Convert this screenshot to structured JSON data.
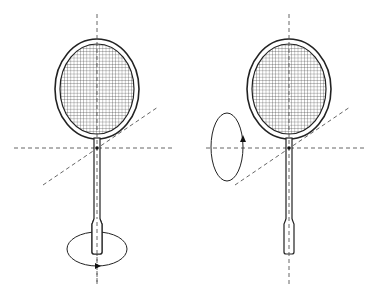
{
  "figure": {
    "width": 369,
    "height": 295,
    "background": "#ffffff",
    "stroke_color": "#222222",
    "axis_color": "#555555"
  },
  "panels": [
    {
      "id": "left",
      "racket": {
        "axis_x": 97,
        "head": {
          "cx": 97,
          "cy": 89,
          "rx_outer": 42,
          "ry_outer": 50,
          "rx_inner": 37,
          "ry_inner": 45
        },
        "shaft": {
          "x1": 94,
          "x2": 100,
          "y_top": 138,
          "y_bottom": 222
        },
        "handle": {
          "x1": 92,
          "x2": 102,
          "y_top": 222,
          "y_bottom": 254
        }
      },
      "axes": {
        "vertical": {
          "x": 97,
          "y1": 14,
          "y2": 285
        },
        "horizontal": {
          "y": 148,
          "x1": 14,
          "x2": 172
        },
        "diagonal": {
          "x1": 43,
          "y1": 185,
          "x2": 158,
          "y2": 107
        }
      },
      "pivot": {
        "x": 97,
        "y": 148
      },
      "rotation": {
        "type": "horizontal-ellipse",
        "cx": 97,
        "cy": 249,
        "rx": 30,
        "ry": 17,
        "arrow_direction": "right",
        "arrow_at": "bottom"
      }
    },
    {
      "id": "right",
      "racket": {
        "axis_x": 289,
        "head": {
          "cx": 289,
          "cy": 89,
          "rx_outer": 42,
          "ry_outer": 50,
          "rx_inner": 37,
          "ry_inner": 45
        },
        "shaft": {
          "x1": 286,
          "x2": 292,
          "y_top": 138,
          "y_bottom": 222
        },
        "handle": {
          "x1": 284,
          "x2": 294,
          "y_top": 222,
          "y_bottom": 254
        }
      },
      "axes": {
        "vertical": {
          "x": 289,
          "y1": 14,
          "y2": 285
        },
        "horizontal": {
          "y": 148,
          "x1": 206,
          "x2": 364
        },
        "diagonal": {
          "x1": 235,
          "y1": 185,
          "x2": 350,
          "y2": 107
        }
      },
      "pivot": {
        "x": 289,
        "y": 148
      },
      "rotation": {
        "type": "vertical-ellipse",
        "cx": 227,
        "cy": 147,
        "rx": 16,
        "ry": 34,
        "arrow_direction": "up",
        "arrow_at": "right"
      }
    }
  ]
}
